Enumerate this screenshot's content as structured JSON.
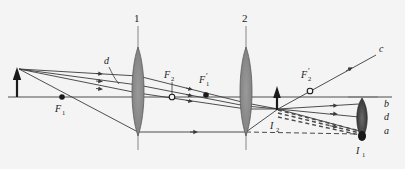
{
  "figure": {
    "background_color": "#f4f4f4",
    "line_color": "#3a3a3a",
    "lens_fill": "#8d8d8d",
    "dashed_color": "#555555"
  },
  "lenses": [
    {
      "id": "lens-1",
      "label": "1",
      "x": 138,
      "top": 47,
      "bottom": 136,
      "half_width": 7
    },
    {
      "id": "lens-2",
      "label": "2",
      "x": 246,
      "top": 47,
      "bottom": 136,
      "half_width": 7
    }
  ],
  "axis": {
    "label": "optical-axis",
    "y": 97,
    "x_start": 8,
    "x_end": 392
  },
  "focal_points": [
    {
      "name": "F1",
      "label": "F",
      "subscript": "1",
      "prime": "",
      "x": 62,
      "y": 97,
      "marker": "filled",
      "label_x": 55,
      "label_y": 110
    },
    {
      "name": "F2",
      "label": "F",
      "subscript": "2",
      "prime": "",
      "x": 172,
      "y": 97,
      "marker": "hollow",
      "label_x": 164,
      "label_y": 80
    },
    {
      "name": "F1p",
      "label": "F",
      "subscript": "1",
      "prime": "′",
      "x": 206,
      "y": 94,
      "marker": "filled",
      "label_x": 199,
      "label_y": 84
    },
    {
      "name": "F2p",
      "label": "F",
      "subscript": "2",
      "prime": "′",
      "x": 310,
      "y": 90,
      "marker": "hollow",
      "label_x": 302,
      "label_y": 79
    }
  ],
  "objects": {
    "source_arrow": {
      "name": "object-arrow",
      "x": 17,
      "base_y": 97,
      "tip_y": 71
    },
    "intermediate_image": {
      "name": "intermediate-image-arrow",
      "x": 277,
      "base_y": 109,
      "tip_y": 88,
      "label": "I",
      "subscript": "2",
      "label_x": 271,
      "label_y": 127
    },
    "final_image": {
      "name": "final-virtual-image",
      "label": "I",
      "subscript": "1",
      "x": 364,
      "y": 134,
      "label_x": 357,
      "label_y": 152
    }
  },
  "eye": {
    "name": "observer-eye",
    "x": 362,
    "y": 118,
    "half_height": 21,
    "half_width": 7
  },
  "ray_labels": [
    {
      "name": "ray-label-c",
      "text": "c",
      "x": 378,
      "y": 50
    },
    {
      "name": "ray-label-b",
      "text": "b",
      "x": 384,
      "y": 107
    },
    {
      "name": "ray-label-d-right",
      "text": "d",
      "x": 384,
      "y": 119
    },
    {
      "name": "ray-label-a",
      "text": "a",
      "x": 384,
      "y": 133
    },
    {
      "name": "ray-label-d-left",
      "text": "d",
      "x": 106,
      "y": 62
    }
  ],
  "leader_line": {
    "name": "d-leader-line",
    "from_x": 110,
    "from_y": 66,
    "to_x": 119,
    "to_y": 84
  },
  "rays": [
    {
      "name": "ray-source-to-lens1-top",
      "points": "19,69 138,76",
      "dashed": false
    },
    {
      "name": "ray-source-to-lens1-mid",
      "points": "19,69 138,85",
      "dashed": false
    },
    {
      "name": "ray-source-to-lens1-low",
      "points": "19,69 138,93",
      "dashed": false
    },
    {
      "name": "ray-source-to-lens1-steep",
      "points": "19,69 138,132",
      "dashed": false
    },
    {
      "name": "ray-lens1-to-lens2-top",
      "points": "138,76 246,103",
      "dashed": false
    },
    {
      "name": "ray-lens1-to-lens2-mid",
      "points": "138,85 246,106",
      "dashed": false
    },
    {
      "name": "ray-lens1-to-lens2-low",
      "points": "138,93 246,109",
      "dashed": false
    },
    {
      "name": "ray-lens1-to-lens2-axis",
      "points": "138,132 246,132",
      "dashed": false
    },
    {
      "name": "ray-lens2-to-image-a",
      "points": "246,103 277,109",
      "dashed": false
    },
    {
      "name": "ray-lens2-to-image-b",
      "points": "246,106 277,109",
      "dashed": false
    },
    {
      "name": "ray-lens2-to-image-c",
      "points": "246,109 277,109",
      "dashed": false
    },
    {
      "name": "ray-lens2-steep-up",
      "points": "246,132 277,109",
      "dashed": false
    },
    {
      "name": "ray-image-to-eye-b",
      "points": "277,109 357,104",
      "dashed": false
    },
    {
      "name": "ray-image-to-eye-d",
      "points": "277,109 357,117",
      "dashed": false
    },
    {
      "name": "ray-image-to-eye-a",
      "points": "277,109 357,131",
      "dashed": false
    },
    {
      "name": "ray-c-through-F2p",
      "points": "277,109 375,56",
      "dashed": false
    },
    {
      "name": "virtual-ray-1",
      "points": "277,109 362,132",
      "dashed": true
    },
    {
      "name": "virtual-ray-2",
      "points": "277,112 362,134",
      "dashed": true
    },
    {
      "name": "virtual-ray-3",
      "points": "277,116 362,136",
      "dashed": true
    },
    {
      "name": "virtual-ray-axis",
      "points": "246,132 362,134",
      "dashed": true
    }
  ]
}
